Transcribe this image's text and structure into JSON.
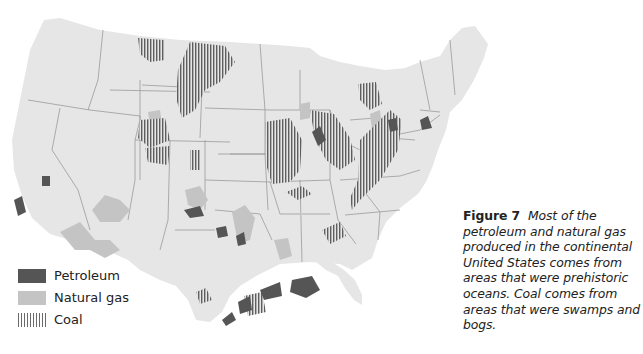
{
  "figure": {
    "label": "Figure 7",
    "caption": "Most of the petroleum and natural gas produced in the continental United States comes from areas that were prehistoric oceans. Coal comes from areas that were swamps and bogs."
  },
  "legend": {
    "items": [
      {
        "label": "Petroleum",
        "pattern": "solid-dark",
        "color": "#555555"
      },
      {
        "label": "Natural gas",
        "pattern": "solid-light",
        "color": "#c4c4c4"
      },
      {
        "label": "Coal",
        "pattern": "vertical-stripes",
        "color": "#6a6a6a"
      }
    ]
  },
  "map": {
    "subject": "Continental United States",
    "land_color": "#e6e6e6",
    "border_color": "#9a9a9a",
    "resource_regions": {
      "coal": [
        "Montana / Wyoming (Powder River)",
        "Utah / Colorado",
        "New Mexico",
        "Illinois Basin",
        "Iowa / Missouri / Kansas",
        "Appalachian",
        "Michigan",
        "Alabama",
        "Texas / Oklahoma"
      ],
      "petroleum": [
        "Gulf Coast (Texas/Louisiana)",
        "California",
        "West Texas",
        "Oklahoma",
        "Illinois / Indiana",
        "Ohio",
        "Pennsylvania",
        "Wyoming"
      ],
      "natural_gas": [
        "Texas / Oklahoma Panhandle",
        "Kansas",
        "Louisiana",
        "Appalachian",
        "Rocky Mountains"
      ]
    }
  }
}
